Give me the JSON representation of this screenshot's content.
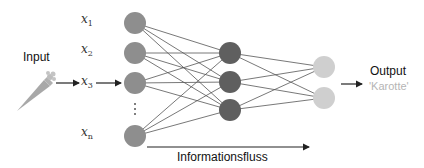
{
  "labels": {
    "input": "Input",
    "output": "Output",
    "output_value": "'Karotte'",
    "flow": "Informationsfluss"
  },
  "input_features": [
    {
      "var": "x",
      "sub": "1"
    },
    {
      "var": "x",
      "sub": "2"
    },
    {
      "var": "x",
      "sub": "3"
    },
    {
      "var": "x",
      "sub": "n"
    }
  ],
  "layers": {
    "input": {
      "count_shown": 4,
      "ellipsis": "⋮",
      "color": "#8e8e8e"
    },
    "hidden": {
      "count": 3,
      "color": "#5f5f5f"
    },
    "output": {
      "count": 2,
      "color": "#cfcfcf"
    }
  },
  "icons": {
    "input_object": "carrot-icon"
  },
  "colors": {
    "edge": "#555555",
    "arrow": "#222222",
    "output_value": "#b5b5b5"
  }
}
